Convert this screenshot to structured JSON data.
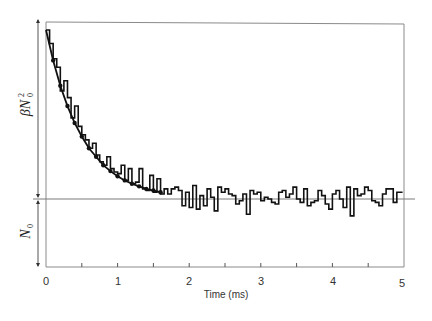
{
  "chart_data": {
    "type": "line",
    "title": "",
    "xlabel": "Time (ms)",
    "ylabel": "",
    "xlim": [
      0,
      5
    ],
    "x_ticks": [
      "0",
      "1",
      "2",
      "3",
      "4",
      "5"
    ],
    "x_minor_ticks": [
      0.5,
      1.5,
      2.5,
      3.5,
      4.5
    ],
    "grid": false,
    "legend": null,
    "annotations": {
      "upper_bracket_label": "βN0²",
      "lower_bracket_label": "N0",
      "baseline": "horizontal line at steady-state level N0"
    },
    "series": [
      {
        "name": "single-channel noise trace (step-like fluctuations)",
        "style": "step",
        "x": [
          0.0,
          0.05,
          0.1,
          0.15,
          0.2,
          0.25,
          0.3,
          0.35,
          0.4,
          0.45,
          0.5,
          0.55,
          0.6,
          0.65,
          0.7,
          0.75,
          0.8,
          0.85,
          0.9,
          0.95,
          1.0,
          1.05,
          1.1,
          1.15,
          1.2,
          1.25,
          1.3,
          1.35,
          1.4,
          1.45,
          1.5,
          1.55,
          1.6,
          1.65,
          1.7,
          1.75,
          1.8,
          1.85,
          1.9,
          1.95,
          2.0,
          2.05,
          2.1,
          2.15,
          2.2,
          2.25,
          2.3,
          2.35,
          2.4,
          2.45,
          2.5,
          2.55,
          2.6,
          2.65,
          2.7,
          2.75,
          2.8,
          2.85,
          2.9,
          2.95,
          3.0,
          3.05,
          3.1,
          3.15,
          3.2,
          3.25,
          3.3,
          3.35,
          3.4,
          3.45,
          3.5,
          3.55,
          3.6,
          3.65,
          3.7,
          3.75,
          3.8,
          3.85,
          3.9,
          3.95,
          4.0,
          4.05,
          4.1,
          4.15,
          4.2,
          4.25,
          4.3,
          4.35,
          4.4,
          4.45,
          4.5,
          4.55,
          4.6,
          4.65,
          4.7,
          4.75,
          4.8,
          4.85,
          4.9,
          4.95
        ],
        "y_rel": [
          1.0,
          0.92,
          0.83,
          0.78,
          0.64,
          0.7,
          0.6,
          0.48,
          0.55,
          0.43,
          0.38,
          0.35,
          0.3,
          0.33,
          0.26,
          0.22,
          0.2,
          0.25,
          0.18,
          0.16,
          0.15,
          0.2,
          0.11,
          0.18,
          0.09,
          0.1,
          0.18,
          0.06,
          0.05,
          0.14,
          0.04,
          0.12,
          0.03,
          0.06,
          0.03,
          0.06,
          0.07,
          0.05,
          -0.04,
          0.04,
          -0.05,
          0.08,
          -0.06,
          0.02,
          -0.04,
          0.06,
          0.01,
          -0.07,
          0.07,
          0.04,
          0.06,
          0.03,
          0.02,
          -0.03,
          -0.01,
          0.03,
          -0.09,
          0.05,
          0.03,
          0.04,
          -0.01,
          0.01,
          0.0,
          -0.02,
          -0.03,
          0.04,
          0.05,
          0.01,
          0.03,
          0.07,
          0.0,
          -0.02,
          0.06,
          -0.04,
          -0.02,
          -0.01,
          0.05,
          0.02,
          -0.03,
          -0.06,
          0.03,
          0.05,
          0.0,
          -0.05,
          0.07,
          -0.1,
          0.06,
          0.02,
          0.03,
          0.07,
          0.05,
          -0.01,
          -0.02,
          -0.04,
          0.03,
          0.06,
          0.06,
          -0.02,
          0.04,
          0.04
        ]
      },
      {
        "name": "fitted exponential decay (with markers)",
        "style": "line-with-markers",
        "x": [
          0.0,
          0.1,
          0.2,
          0.3,
          0.4,
          0.5,
          0.6,
          0.7,
          0.8,
          0.9,
          1.0,
          1.1,
          1.2,
          1.3,
          1.4,
          1.5,
          1.6
        ],
        "y_rel": [
          1.0,
          0.82,
          0.67,
          0.55,
          0.45,
          0.37,
          0.3,
          0.25,
          0.2,
          0.165,
          0.135,
          0.11,
          0.09,
          0.075,
          0.06,
          0.05,
          0.04
        ]
      }
    ],
    "y_rel_note": "y_rel is fraction of βN0² height above the N0 baseline (1.0 = top of bracket, 0 = baseline)"
  },
  "labels": {
    "x_axis_title": "Time (ms)",
    "ticks": [
      "0",
      "1",
      "2",
      "3",
      "4",
      "5"
    ],
    "beta_n0_squared_main": "βN",
    "beta_n0_squared_sup": "2",
    "beta_n0_squared_sub": "0",
    "n0_main": "N",
    "n0_sub": "0"
  },
  "colors": {
    "trace": "#111111",
    "frame": "#8a8a8a",
    "baseline": "#7a7a7a",
    "text": "#333333"
  }
}
